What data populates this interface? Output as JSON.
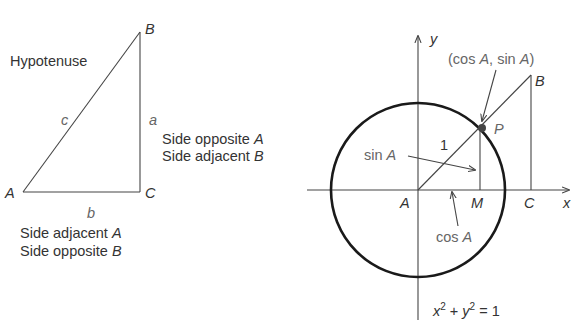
{
  "triangle": {
    "vertices": {
      "A": "A",
      "B": "B",
      "C": "C"
    },
    "sides": {
      "a": "a",
      "b": "b",
      "c": "c"
    },
    "hypotenuse_label": "Hypotenuse",
    "side_a_labels": {
      "line1_text": "Side opposite ",
      "line1_var": "A",
      "line2_text": "Side adjacent ",
      "line2_var": "B"
    },
    "side_b_labels": {
      "line1_text": "Side adjacent ",
      "line1_var": "A",
      "line2_text": "Side opposite ",
      "line2_var": "B"
    }
  },
  "unit_circle": {
    "axis_x": "x",
    "axis_y": "y",
    "origin": "A",
    "point_P": "P",
    "point_M": "M",
    "point_C": "C",
    "point_B": "B",
    "radius_label": "1",
    "point_coords": {
      "open": "(cos ",
      "var1": "A",
      "mid": ", sin ",
      "var2": "A",
      "close": ")"
    },
    "sin_label": {
      "fn": "sin ",
      "var": "A"
    },
    "cos_label": {
      "fn": "cos ",
      "var": "A"
    },
    "equation": {
      "x": "x",
      "x_exp": "2",
      "plus": " + ",
      "y": "y",
      "y_exp": "2",
      "eq": " = 1"
    }
  },
  "colors": {
    "ink": "#333333",
    "circle": "#1a1a1a",
    "background": "#ffffff"
  }
}
